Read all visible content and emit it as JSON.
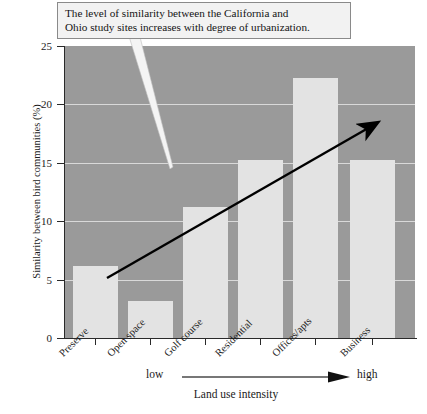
{
  "callout": {
    "line1": "The level of similarity between the California and",
    "line2": "Ohio study sites increases with degree of urbanization."
  },
  "axis": {
    "ylabel": "Similarity between bird communities (%)",
    "yticks": [
      "0",
      "5",
      "10",
      "15",
      "20",
      "25"
    ],
    "intensity_low": "low",
    "intensity_high": "high",
    "intensity_caption": "Land use intensity"
  },
  "colors": {
    "plot_background": "#9a9a9a",
    "bar_fill": "#e3e3e3",
    "gridline": "#d9d9d9",
    "axis": "#2a2a2a",
    "callout_background": "#f2f2f2",
    "callout_border": "#8a8a8a",
    "trend_arrow": "#000000"
  },
  "chart_data": {
    "type": "bar",
    "title": "",
    "categories": [
      "Preserve",
      "Open space",
      "Golf course",
      "Residential",
      "Offices/apts",
      "Business"
    ],
    "values": [
      6.2,
      3.2,
      11.2,
      15.2,
      22.3,
      15.2
    ],
    "xlabel": "Land use intensity",
    "ylabel": "Similarity between bird communities (%)",
    "ylim": [
      0,
      25
    ],
    "ytick_values": [
      0,
      5,
      10,
      15,
      20,
      25
    ],
    "grid": true,
    "legend": "none",
    "annotations": [
      {
        "type": "callout",
        "text": "The level of similarity between the California and Ohio study sites increases with degree of urbanization."
      },
      {
        "type": "trend-arrow",
        "direction": "up-right",
        "from_category": "Preserve",
        "to_category": "Business"
      }
    ]
  }
}
